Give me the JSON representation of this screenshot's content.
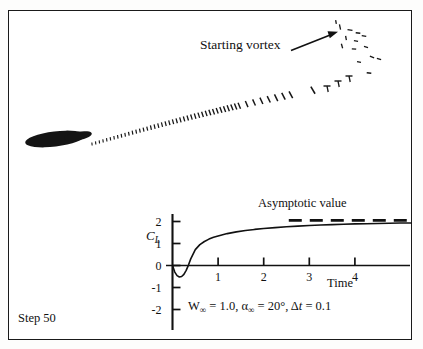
{
  "figure": {
    "caption_step": "Step 50",
    "annotations": {
      "starting_vortex": "Starting vortex",
      "asymptotic_value": "Asymptotic value",
      "parameters_plain": "W∞ = 1.0, α∞ = 20°, Δt = 0.1",
      "param_w_symbol": "W",
      "param_w_sub": "∞",
      "param_w_eq": " = 1.0, ",
      "param_alpha_symbol": "α",
      "param_alpha_sub": "∞",
      "param_alpha_eq": " = 20°, ",
      "param_delta_symbol": "Δ",
      "param_delta_t": "t",
      "param_delta_eq": " = 0.1"
    },
    "colors": {
      "ink": "#111111",
      "frame": "#1a1a1a",
      "page": "#ffffff"
    }
  },
  "chart_data": {
    "type": "line",
    "title": "",
    "xlabel": "Time",
    "ylabel": "C_L",
    "ylabel_symbol": "C",
    "ylabel_sub": "L",
    "xticks": [
      1,
      2,
      3,
      4
    ],
    "xtick_labels": [
      "1",
      "2",
      "3",
      "4"
    ],
    "yticks": [
      2,
      1,
      0,
      -1,
      -2
    ],
    "ytick_labels": [
      "2",
      "1",
      "0",
      "-1",
      "-2"
    ],
    "xlim": [
      0,
      5.3
    ],
    "ylim": [
      -2.4,
      2.45
    ],
    "grid": false,
    "legend": "none",
    "series": [
      {
        "name": "Lift coefficient",
        "style": "solid",
        "x": [
          0.0,
          0.05,
          0.1,
          0.15,
          0.2,
          0.25,
          0.3,
          0.35,
          0.4,
          0.5,
          0.6,
          0.7,
          0.8,
          0.9,
          1.0,
          1.2,
          1.4,
          1.6,
          1.8,
          2.0,
          2.25,
          2.5,
          2.75,
          3.0,
          3.25,
          3.5,
          3.75,
          4.0,
          4.25,
          4.5,
          4.75,
          5.0,
          5.25
        ],
        "y": [
          0.0,
          -0.3,
          -0.46,
          -0.52,
          -0.5,
          -0.4,
          -0.22,
          0.02,
          0.3,
          0.72,
          0.95,
          1.09,
          1.2,
          1.28,
          1.34,
          1.45,
          1.53,
          1.59,
          1.64,
          1.68,
          1.72,
          1.76,
          1.79,
          1.82,
          1.84,
          1.86,
          1.875,
          1.89,
          1.9,
          1.91,
          1.92,
          1.93,
          1.935
        ]
      },
      {
        "name": "Asymptotic value",
        "style": "dashed",
        "x": [
          2.55,
          5.3
        ],
        "y": [
          2.05,
          2.05
        ]
      }
    ],
    "annotations": [
      {
        "text": "Asymptotic value",
        "x": 3.1,
        "y": 2.45
      },
      {
        "text": "W∞ = 1.0, α∞ = 20°, Δt = 0.1",
        "x": 0.45,
        "y": -1.62
      }
    ]
  },
  "flowfield": {
    "description": "Airfoil with shed vortex sheet and rolled-up starting vortex",
    "airfoil": {
      "cx": 55,
      "cy": 139,
      "rx": 30,
      "ry": 7.5,
      "angle_deg": -7
    },
    "arrow": {
      "x1": 292,
      "y1": 50,
      "x2": 337,
      "y2": 33
    }
  }
}
